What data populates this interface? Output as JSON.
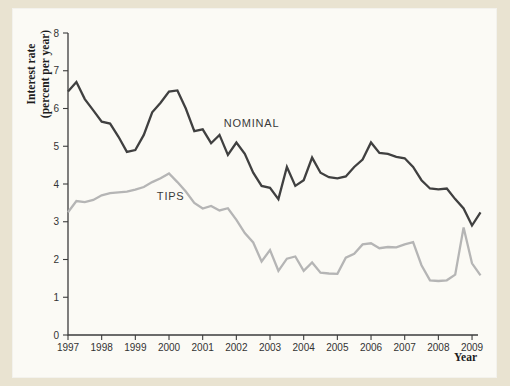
{
  "figure": {
    "panel_background": "#fbfaf5",
    "page_background": "#e9e3d1",
    "axis_color": "#3c3c3c",
    "tick_label_color": "#333333"
  },
  "chart_data": {
    "type": "line",
    "title": "",
    "xlabel": "Year",
    "ylabel": "Interest rate (percent per year)",
    "ylabel_lines": [
      "Interest rate",
      "(percent per year)"
    ],
    "ylim": [
      0,
      8
    ],
    "xlim": [
      1997,
      2009.3
    ],
    "y_ticks": [
      0,
      1,
      2,
      3,
      4,
      5,
      6,
      7,
      8
    ],
    "x_ticks": [
      1997,
      1998,
      1999,
      2000,
      2001,
      2002,
      2003,
      2004,
      2005,
      2006,
      2007,
      2008,
      2009
    ],
    "grid": false,
    "legend_position": "inline-annotations",
    "x_start": 1997,
    "x_step": 0.25,
    "series": [
      {
        "name": "NOMINAL",
        "color": "#404040",
        "values": [
          6.45,
          6.7,
          6.25,
          5.95,
          5.65,
          5.6,
          5.25,
          4.85,
          4.9,
          5.3,
          5.9,
          6.15,
          6.45,
          6.48,
          6.0,
          5.4,
          5.45,
          5.08,
          5.3,
          4.77,
          5.1,
          4.8,
          4.3,
          3.95,
          3.9,
          3.6,
          4.45,
          3.95,
          4.1,
          4.7,
          4.3,
          4.18,
          4.15,
          4.2,
          4.45,
          4.65,
          5.1,
          4.82,
          4.8,
          4.72,
          4.68,
          4.45,
          4.1,
          3.88,
          3.86,
          3.88,
          3.6,
          3.35,
          2.9,
          3.25
        ]
      },
      {
        "name": "TIPS",
        "color": "#b5b5b5",
        "values": [
          3.25,
          3.55,
          3.52,
          3.58,
          3.7,
          3.76,
          3.78,
          3.8,
          3.85,
          3.92,
          4.05,
          4.15,
          4.28,
          4.05,
          3.8,
          3.5,
          3.35,
          3.42,
          3.3,
          3.36,
          3.05,
          2.7,
          2.45,
          1.95,
          2.25,
          1.7,
          2.02,
          2.08,
          1.7,
          1.92,
          1.65,
          1.63,
          1.62,
          2.05,
          2.15,
          2.4,
          2.43,
          2.3,
          2.33,
          2.32,
          2.4,
          2.46,
          1.85,
          1.45,
          1.43,
          1.45,
          1.6,
          2.85,
          1.9,
          1.58
        ]
      }
    ],
    "annotations": [
      {
        "text": "NOMINAL",
        "x": 2002.45,
        "y": 5.52,
        "series": "NOMINAL"
      },
      {
        "text": "TIPS",
        "x": 2000.05,
        "y": 3.58,
        "series": "TIPS"
      }
    ]
  }
}
